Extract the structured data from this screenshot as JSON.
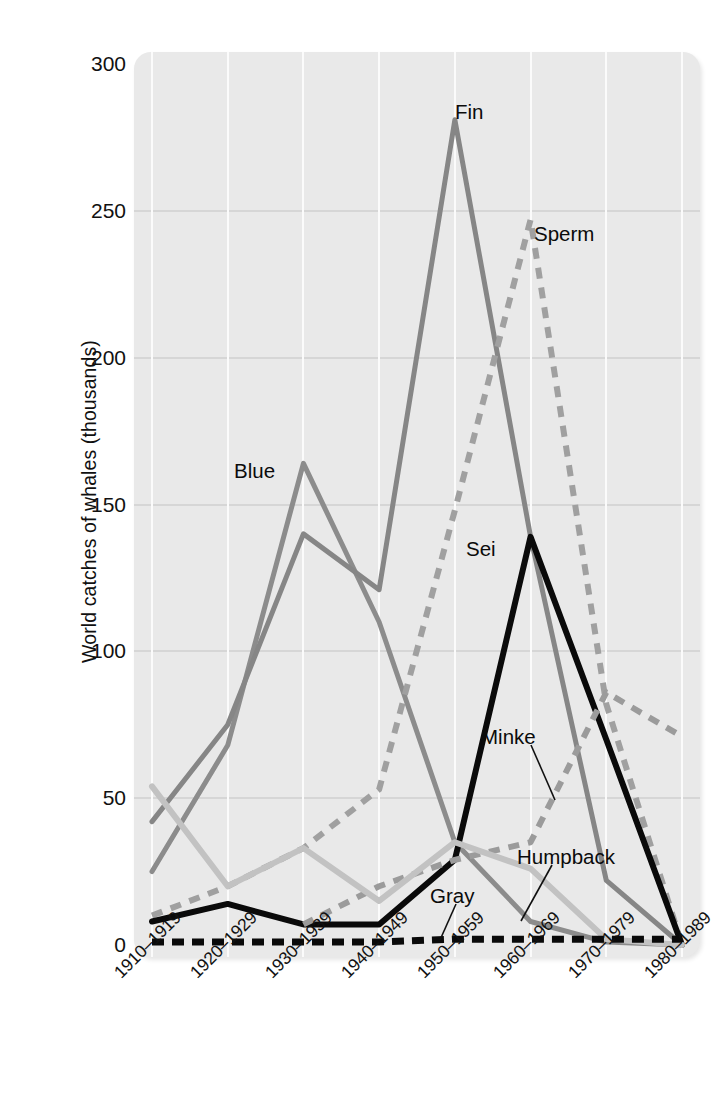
{
  "chart_data": {
    "type": "line",
    "title": "",
    "xlabel": "",
    "ylabel": "World catches of whales (thousands)",
    "categories": [
      "1910–1919",
      "1920–1929",
      "1930–1939",
      "1940–1949",
      "1950–1959",
      "1960–1969",
      "1970–1979",
      "1980–1989"
    ],
    "ylim": [
      0,
      300
    ],
    "yticks": [
      0,
      50,
      100,
      150,
      200,
      250,
      300
    ],
    "ytick_labels": [
      "0",
      "50",
      "100",
      "150",
      "200",
      "250",
      "300"
    ],
    "grid": true,
    "legend": "inline-annotations",
    "series": [
      {
        "name": "Blue",
        "style": "solid",
        "color": "#8c8c8c",
        "width": 5,
        "values": [
          25,
          68,
          164,
          110,
          35,
          8,
          1,
          0
        ]
      },
      {
        "name": "Fin",
        "style": "solid",
        "color": "#868686",
        "width": 5,
        "values": [
          42,
          75,
          140,
          121,
          281,
          139,
          22,
          0
        ]
      },
      {
        "name": "Sperm",
        "style": "dashed",
        "color": "#a0a0a0",
        "width": 6,
        "values": [
          10,
          20,
          33,
          53,
          148,
          247,
          82,
          0
        ]
      },
      {
        "name": "Sei",
        "style": "solid",
        "color": "#0a0a0a",
        "width": 6,
        "values": [
          8,
          14,
          7,
          7,
          29,
          139,
          70,
          0
        ]
      },
      {
        "name": "Minke",
        "style": "dashed",
        "color": "#9b9b9b",
        "width": 6,
        "values": [
          0,
          0,
          7,
          20,
          29,
          35,
          86,
          71
        ]
      },
      {
        "name": "Humpback",
        "style": "solid",
        "color": "#c2c2c2",
        "width": 6,
        "values": [
          54,
          20,
          33,
          15,
          35,
          26,
          2,
          0
        ]
      },
      {
        "name": "Gray",
        "style": "dashed",
        "color": "#0a0a0a",
        "width": 7,
        "values": [
          1,
          1,
          1,
          1,
          2,
          2,
          2,
          2
        ]
      }
    ],
    "annotations": [
      {
        "label": "Fin",
        "x": 455,
        "y": 100,
        "leader": false
      },
      {
        "label": "Sperm",
        "x": 534,
        "y": 222,
        "leader": false
      },
      {
        "label": "Blue",
        "x": 234,
        "y": 459,
        "leader": false
      },
      {
        "label": "Sei",
        "x": 466,
        "y": 537,
        "leader": false
      },
      {
        "label": "Minke",
        "x": 481,
        "y": 725,
        "leader": true,
        "lx1": 531,
        "ly1": 745,
        "lx2": 555,
        "ly2": 800
      },
      {
        "label": "Humpback",
        "x": 517,
        "y": 845,
        "leader": true,
        "lx1": 552,
        "ly1": 865,
        "lx2": 521,
        "ly2": 921
      },
      {
        "label": "Gray",
        "x": 430,
        "y": 884,
        "leader": true,
        "lx1": 456,
        "ly1": 904,
        "lx2": 440,
        "ly2": 940
      }
    ]
  }
}
